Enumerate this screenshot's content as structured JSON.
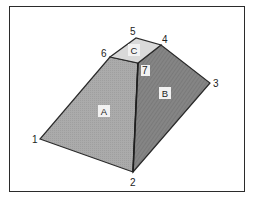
{
  "diagram": {
    "type": "frustum-pyramid",
    "vertices": [
      {
        "id": "1",
        "x": 40,
        "y": 139,
        "label_x": 32,
        "label_y": 143
      },
      {
        "id": "2",
        "x": 133,
        "y": 172,
        "label_x": 131,
        "label_y": 186
      },
      {
        "id": "3",
        "x": 210,
        "y": 83,
        "label_x": 214,
        "label_y": 87
      },
      {
        "id": "4",
        "x": 161,
        "y": 45,
        "label_x": 162,
        "label_y": 43
      },
      {
        "id": "5",
        "x": 136,
        "y": 38,
        "label_x": 131,
        "label_y": 35
      },
      {
        "id": "6",
        "x": 110,
        "y": 57,
        "label_x": 101,
        "label_y": 56
      },
      {
        "id": "7",
        "x": 138,
        "y": 63,
        "label_x": 145,
        "label_y": 74
      }
    ],
    "faces": [
      {
        "id": "A",
        "points": "40,139 133,172 138,63 110,57",
        "fill": "#a8a8a8",
        "label_x": 104,
        "label_y": 114
      },
      {
        "id": "B",
        "points": "133,172 210,83 161,45 138,63",
        "fill": "#808080",
        "label_x": 165,
        "label_y": 96
      },
      {
        "id": "C",
        "points": "110,57 138,63 161,45 136,38",
        "fill": "#d9d9d9",
        "label_x": 134,
        "label_y": 53
      }
    ],
    "colors": {
      "edge": "#2a2a2a",
      "frame": "#2b2b2b",
      "label_bg": "#f2f2f2"
    }
  },
  "labels": {
    "v1": "1",
    "v2": "2",
    "v3": "3",
    "v4": "4",
    "v5": "5",
    "v6": "6",
    "v7": "7",
    "faceA": "A",
    "faceB": "B",
    "faceC": "C"
  }
}
